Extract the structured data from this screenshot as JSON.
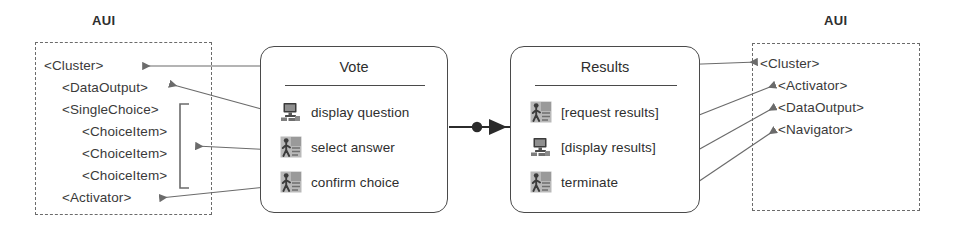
{
  "diagram": {
    "type": "task-model-to-aui-mapping",
    "background": "#ffffff",
    "line_color": "#6b6b6b",
    "box_border_color": "#4a4a4a",
    "text_color": "#2e2e2e"
  },
  "left_panel": {
    "label": "AUI",
    "items": [
      {
        "text": "<Cluster>",
        "indent": 0
      },
      {
        "text": "<DataOutput>",
        "indent": 1
      },
      {
        "text": "<SingleChoice>",
        "indent": 1
      },
      {
        "text": "<ChoiceItem>",
        "indent": 2
      },
      {
        "text": "<ChoiceItem>",
        "indent": 2
      },
      {
        "text": "<ChoiceItem>",
        "indent": 2
      },
      {
        "text": "<Activator>",
        "indent": 1
      }
    ]
  },
  "right_panel": {
    "label": "AUI",
    "items": [
      {
        "text": "<Cluster>",
        "indent": 0
      },
      {
        "text": "<Activator>",
        "indent": 1
      },
      {
        "text": "<DataOutput>",
        "indent": 1
      },
      {
        "text": "<Navigator>",
        "indent": 1
      }
    ]
  },
  "task_boxes": [
    {
      "title": "Vote",
      "rows": [
        {
          "label": "display question",
          "icon": "monitor-icon"
        },
        {
          "label": "select answer",
          "icon": "user-interaction-icon"
        },
        {
          "label": "confirm choice",
          "icon": "user-interaction-icon"
        }
      ]
    },
    {
      "title": "Results",
      "rows": [
        {
          "label": "[request results]",
          "icon": "user-interaction-icon"
        },
        {
          "label": "[display results]",
          "icon": "monitor-icon"
        },
        {
          "label": "terminate",
          "icon": "user-interaction-icon"
        }
      ]
    }
  ],
  "connectors": {
    "sequence_link": {
      "name": "ball-and-arrow-connector",
      "from": "Vote",
      "to": "Results"
    },
    "mappings_left": [
      {
        "from": "Vote",
        "to": "<Cluster>"
      },
      {
        "from": "display question",
        "to": "<DataOutput>"
      },
      {
        "from": "select answer",
        "to": "<ChoiceItem> group"
      },
      {
        "from": "confirm choice",
        "to": "<Activator>"
      }
    ],
    "mappings_right": [
      {
        "from": "Results",
        "to": "<Cluster>"
      },
      {
        "from": "[request results]",
        "to": "<Activator>"
      },
      {
        "from": "[display results]",
        "to": "<DataOutput>"
      },
      {
        "from": "terminate",
        "to": "<Navigator>"
      }
    ]
  }
}
